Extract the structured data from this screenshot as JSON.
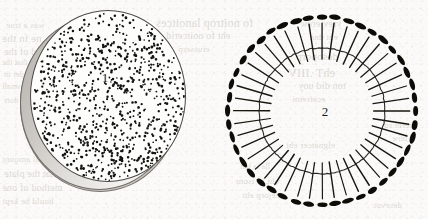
{
  "plate": {
    "width": 428,
    "height": 219,
    "background_color": "#fbfaf8",
    "ink_color": "#1a1a1a",
    "paper_tint": "#f2efe9"
  },
  "figures": [
    {
      "id": "figure-1",
      "label": "1",
      "kind": "stippled-disk",
      "description": "Circular disk rendered in stipple (random dots) with a shaded side wall suggesting thickness",
      "label_position": {
        "x": 105,
        "y": 78
      },
      "center": {
        "x": 107,
        "y": 96
      },
      "radius_x": 78,
      "radius_y": 86,
      "dot_count": 900,
      "dot_color": "#15150f",
      "dot_radius": 1.05,
      "rim_color": "#c9c6c1",
      "outline_color": "#4c4944",
      "rim_offset": {
        "x": -10,
        "y": 6
      }
    },
    {
      "id": "figure-2",
      "label": "2",
      "kind": "pinned-circle",
      "description": "Thin circle outline crossed by radial spokes, each spoke capped outside the circle with a solid elongated oval",
      "label_position": {
        "x": 325,
        "y": 112
      },
      "center": {
        "x": 322,
        "y": 111
      },
      "circle_radius": 63,
      "spoke_count": 44,
      "spoke_inner_radius": 52,
      "spoke_outer_radius": 88,
      "spoke_color": "#17170f",
      "spoke_width": 1.15,
      "cap_radius": 94,
      "cap_length": 11,
      "cap_thickness": 5,
      "cap_color": "#0d0d08",
      "circle_color": "#2b2a25",
      "circle_width": 1.1
    }
  ],
  "showthrough": {
    "note": "Faint mirrored text bleeding through from the reverse side of the printed page",
    "lines": [
      {
        "x": 6,
        "y": 20,
        "size": 9,
        "text": "was a true"
      },
      {
        "x": 2,
        "y": 32,
        "size": 11,
        "text": "ne in the"
      },
      {
        "x": 4,
        "y": 46,
        "size": 10,
        "text": "d of the"
      },
      {
        "x": 2,
        "y": 58,
        "size": 8,
        "text": "so that the"
      },
      {
        "x": 4,
        "y": 70,
        "size": 8,
        "text": "order to"
      },
      {
        "x": 2,
        "y": 82,
        "size": 8,
        "text": "a small"
      },
      {
        "x": 4,
        "y": 96,
        "size": 8,
        "text": "the dots"
      },
      {
        "x": 156,
        "y": 16,
        "size": 12,
        "text": "fo noitrop lanoitces"
      },
      {
        "x": 166,
        "y": 30,
        "size": 10,
        "text": "eht fo noitcerid"
      },
      {
        "x": 178,
        "y": 44,
        "size": 9,
        "text": "erusserp"
      },
      {
        "x": 300,
        "y": 18,
        "size": 10,
        "text": "yrev erew"
      },
      {
        "x": 310,
        "y": 32,
        "size": 9,
        "text": "eht dna"
      },
      {
        "x": 296,
        "y": 50,
        "size": 11,
        "text": "desoporp"
      },
      {
        "x": 288,
        "y": 66,
        "size": 12,
        "text": "ehT .IIIV"
      },
      {
        "x": 298,
        "y": 80,
        "size": 10,
        "text": "ton did uoy"
      },
      {
        "x": 292,
        "y": 94,
        "size": 9,
        "text": "ecafretni"
      },
      {
        "x": 286,
        "y": 140,
        "size": 9,
        "text": "elgnatcer eht"
      },
      {
        "x": 2,
        "y": 154,
        "size": 9,
        "text": "A small amount"
      },
      {
        "x": 4,
        "y": 168,
        "size": 10,
        "text": "so that the plate"
      },
      {
        "x": 2,
        "y": 182,
        "size": 10,
        "text": "method of one"
      },
      {
        "x": 2,
        "y": 196,
        "size": 9,
        "text": "hould be kept"
      },
      {
        "x": 240,
        "y": 162,
        "size": 8,
        "text": "lla ta ton"
      },
      {
        "x": 236,
        "y": 176,
        "size": 9,
        "text": "eht fo tsom"
      },
      {
        "x": 242,
        "y": 190,
        "size": 9,
        "text": "tcejorp eht"
      },
      {
        "x": 384,
        "y": 120,
        "size": 9,
        "text": "eerht ro"
      },
      {
        "x": 392,
        "y": 134,
        "size": 8,
        "text": "htiw"
      },
      {
        "x": 372,
        "y": 200,
        "size": 9,
        "text": "derevoc"
      }
    ]
  }
}
